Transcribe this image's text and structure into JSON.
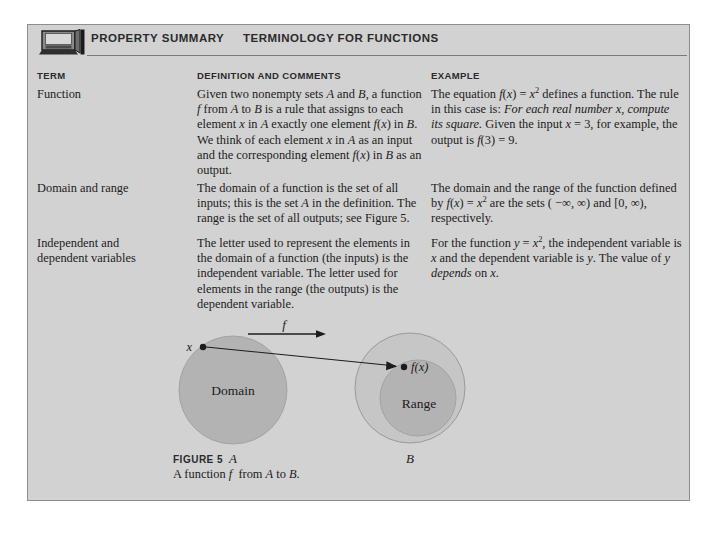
{
  "header": {
    "icon": "computer-monitor-icon",
    "property_summary": "PROPERTY SUMMARY",
    "terminology": "TERMINOLOGY FOR FUNCTIONS"
  },
  "columns": {
    "term": "TERM",
    "definition": "DEFINITION AND COMMENTS",
    "example": "EXAMPLE"
  },
  "rows": [
    {
      "term_html": "Function",
      "definition_html": "Given two nonempty sets <i>A</i> and <i>B</i>, a function <i>f</i> from <i>A</i> to <i>B</i> is a rule that assigns to each element <i>x</i> in <i>A</i> exactly one element <i>f</i>(<i>x</i>) in <i>B</i>. We think of each element <i>x</i> in <i>A</i> as an input and the corresponding element <i>f</i>(<i>x</i>) in <i>B</i> as an output.",
      "example_html": "The equation <i>f</i>(<i>x</i>) = <i>x</i><sup>2</sup> defines a function. The rule in this case is: <i>For each real number x, compute its square.</i> Given the input <i>x</i> = 3, for example, the output is <i>f</i>(3) = 9.",
      "term_text": "Function",
      "definition_text": "Given two nonempty sets A and B, a function f from A to B is a rule that assigns to each element x in A exactly one element f(x) in B. We think of each element x in A as an input and the corresponding element f(x) in B as an output.",
      "example_text": "The equation f(x) = x^2 defines a function. The rule in this case is: For each real number x, compute its square. Given the input x = 3, for example, the output is f(3) = 9."
    },
    {
      "term_html": "Domain and range",
      "definition_html": "The domain of a function is the set of all inputs; this is the set <i>A</i> in the definition. The range is the set of all outputs; see Figure 5.",
      "example_html": "The domain and the range of the function defined by <i>f</i>(<i>x</i>) = <i>x</i><sup>2</sup> are the sets ( &minus;&infin;, &infin;) and [0, &infin;), respectively.",
      "term_text": "Domain and range",
      "definition_text": "The domain of a function is the set of all inputs; this is the set A in the definition. The range is the set of all outputs; see Figure 5.",
      "example_text": "The domain and the range of the function defined by f(x) = x^2 are the sets (-inf, inf) and [0, inf), respectively."
    },
    {
      "term_html": "Independent and<br>dependent variables",
      "definition_html": "The letter used to represent the elements in the domain of a function (the inputs) is the independent variable. The letter used for elements in the range (the outputs) is the dependent variable.",
      "example_html": "For the function <i>y</i> = <i>x</i><sup>2</sup>, the independent variable is <i>x</i> and the dependent variable is <i>y</i>. The value of <i>y</i> <i>depends</i> on <i>x</i>.",
      "term_text": "Independent and dependent variables",
      "definition_text": "The letter used to represent the elements in the domain of a function (the inputs) is the independent variable. The letter used for elements in the range (the outputs) is the dependent variable.",
      "example_text": "For the function y = x^2, the independent variable is x and the dependent variable is y. The value of y depends on x."
    }
  ],
  "figure": {
    "number": "FIGURE 5",
    "caption_html": "A function <i>f</i> &nbsp;from <i>A</i> to <i>B</i>.",
    "caption_text": "A function f from A to B.",
    "labels": {
      "map_arrow": "f",
      "domain_point": "x",
      "domain_set": "Domain",
      "domain_letter": "A",
      "range_point": "f(x)",
      "range_set": "Range",
      "codomain_letter": "B"
    }
  },
  "colors": {
    "panel_background": "#d2d2d2",
    "panel_border": "#8e8e8e",
    "circle_fill": "#b3b3b3",
    "outer_circle_fill": "#c6c6c6",
    "text": "#1c1c1c",
    "page_background": "#ffffff"
  }
}
